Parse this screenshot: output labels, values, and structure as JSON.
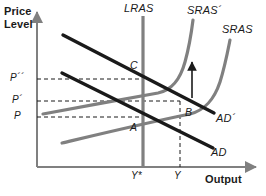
{
  "figure": {
    "title_axis_y": "Price\nLevel",
    "axis": {
      "y_label_line1": "Price",
      "y_label_line2": "Level",
      "x_label": "Output"
    },
    "colors": {
      "demand_curve": "#1a1a1a",
      "supply_curve": "#808080",
      "lras_line": "#808080",
      "axis": "#808080",
      "dashed_guide": "#1a1a1a",
      "text": "#1a1a1a"
    },
    "curves": [
      {
        "id": "lras",
        "label": "LRAS",
        "type": "vertical",
        "color": "#808080"
      },
      {
        "id": "sras2",
        "label": "SRAS´",
        "type": "j-curve",
        "color": "#808080"
      },
      {
        "id": "sras1",
        "label": "SRAS",
        "type": "j-curve",
        "color": "#808080"
      },
      {
        "id": "ad2",
        "label": "AD´",
        "type": "line",
        "color": "#1a1a1a"
      },
      {
        "id": "ad1",
        "label": "AD",
        "type": "line",
        "color": "#1a1a1a"
      }
    ],
    "equilibria": [
      {
        "id": "A",
        "label": "A",
        "price_label": "P",
        "output_label": "Y*"
      },
      {
        "id": "B",
        "label": "B",
        "price_label": "P´",
        "output_label": "Y"
      },
      {
        "id": "C",
        "label": "C",
        "price_label": "P´´",
        "output_label": "Y*"
      }
    ],
    "price_ticks": [
      {
        "id": "p2",
        "label": "P´´"
      },
      {
        "id": "p1",
        "label": "P´"
      },
      {
        "id": "p0",
        "label": "P"
      }
    ],
    "output_ticks": [
      {
        "id": "ystar",
        "label": "Y*"
      },
      {
        "id": "y",
        "label": "Y"
      }
    ],
    "annotations": [
      {
        "id": "shift-arrow",
        "label": "",
        "meaning": "upward shift of SRAS"
      }
    ]
  }
}
